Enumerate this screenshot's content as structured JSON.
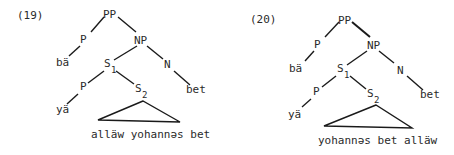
{
  "trees": [
    {
      "number": "(19)",
      "nodes": {
        "pp": "PP",
        "p1": "P",
        "ba": "bä",
        "np": "NP",
        "s1": "S",
        "s1_sub": "1",
        "n": "N",
        "p2": "P",
        "ya": "yä",
        "s2": "S",
        "s2_sub": "2",
        "bet": "bet"
      },
      "triangle_text": "alläw yohannəs bet"
    },
    {
      "number": "(20)",
      "nodes": {
        "pp": "PP",
        "p1": "P",
        "ba": "bä",
        "np": "NP",
        "s1": "S",
        "s1_sub": "1",
        "n": "N",
        "p2": "P",
        "ya": "yä",
        "s2": "S",
        "s2_sub": "2",
        "bet": "bet"
      },
      "triangle_text": "yohannəs bet alläw"
    }
  ]
}
